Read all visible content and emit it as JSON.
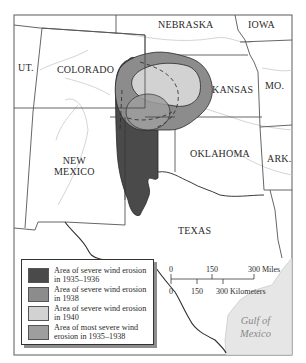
{
  "map": {
    "states": [
      {
        "name": "NEBRASKA"
      },
      {
        "name": "IOWA"
      },
      {
        "name": "UT."
      },
      {
        "name": "COLORADO"
      },
      {
        "name": "KANSAS"
      },
      {
        "name": "MO."
      },
      {
        "name": "NEW MEXICO",
        "line1": "NEW",
        "line2": "MEXICO"
      },
      {
        "name": "OKLAHOMA"
      },
      {
        "name": "ARK."
      },
      {
        "name": "TEXAS"
      }
    ],
    "water": {
      "line1": "Gulf of",
      "line2": "Mexico"
    }
  },
  "legend": {
    "items": [
      {
        "label": "Area of severe wind erosion in 1935–1936",
        "color": "#4a4a4a"
      },
      {
        "label": "Area of severe wind erosion in 1938",
        "color": "#8c8c8c"
      },
      {
        "label": "Area of severe wind erosion in 1940",
        "color": "#d2d2d2"
      },
      {
        "label": "Area of most severe wind erosion in 1935–1938",
        "color": "#9e9e9e"
      }
    ]
  },
  "scale": {
    "miles": {
      "ticks": [
        "0",
        "150",
        "300"
      ],
      "unit": "Miles"
    },
    "kilometers": {
      "ticks": [
        "0",
        "150",
        "300"
      ],
      "unit": "Kilometers"
    }
  },
  "colors": {
    "erosion_1935_1936": "#4a4a4a",
    "erosion_1938": "#8c8c8c",
    "erosion_1940": "#d2d2d2",
    "most_severe_1935_1938": "#9e9e9e",
    "gulf": "#e6e6e6",
    "borders": "#4d4d4d",
    "rivers": "#c8c8c8"
  }
}
